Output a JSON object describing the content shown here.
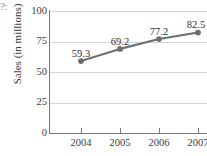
{
  "corner_text": "?:",
  "chart_data": {
    "type": "line",
    "title": "",
    "xlabel": "",
    "ylabel": "Sales (in millions)",
    "categories": [
      "2004",
      "2005",
      "2006",
      "2007"
    ],
    "values": [
      59.3,
      69.2,
      77.2,
      82.5
    ],
    "data_labels": [
      "59.3",
      "69.2",
      "77.2",
      "82.5"
    ],
    "ylim": [
      0,
      100
    ],
    "yticks": [
      0,
      25,
      50,
      75,
      100
    ],
    "ytick_labels": [
      "0",
      "25",
      "50",
      "75",
      "100"
    ],
    "grid": true,
    "legend": "none",
    "series_color": "#6e6e6e",
    "marker_color": "#6e6e6e",
    "grid_color": "#d6d6d6",
    "axis_color": "#787878",
    "text_color": "#3b3b3b",
    "background": "#ffffff"
  }
}
